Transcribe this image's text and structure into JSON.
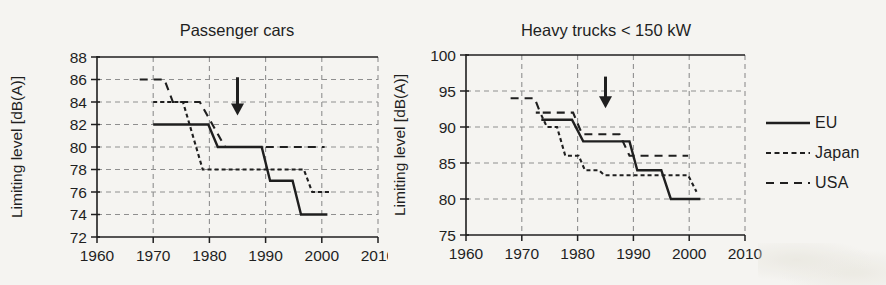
{
  "colors": {
    "ink": "#1f1f1f",
    "grid": "#8f8f8f",
    "background": "#f5f4f1"
  },
  "legend": {
    "items": [
      {
        "label": "EU",
        "style": "solid"
      },
      {
        "label": "Japan",
        "style": "short-dash"
      },
      {
        "label": "USA",
        "style": "long-dash"
      }
    ]
  },
  "chart_data": [
    {
      "type": "line",
      "title": "Passenger cars",
      "xlabel": "",
      "ylabel": "Limiting level [dB(A)]",
      "xlim": [
        1960,
        2010
      ],
      "ylim": [
        72,
        88
      ],
      "xticks": [
        1960,
        1970,
        1980,
        1990,
        2000,
        2010
      ],
      "yticks": [
        72,
        74,
        76,
        78,
        80,
        82,
        84,
        86,
        88
      ],
      "grid": true,
      "legend_position": "outside-right",
      "annotation_arrow": {
        "x": 1985,
        "y_from": 86.2,
        "y_to": 82.8
      },
      "series": [
        {
          "name": "EU",
          "style": "solid",
          "points": [
            [
              1970,
              82
            ],
            [
              1979.8,
              82
            ],
            [
              1981.5,
              80
            ],
            [
              1989.3,
              80
            ],
            [
              1990.8,
              77
            ],
            [
              1994.8,
              77
            ],
            [
              1996.3,
              74
            ],
            [
              2001,
              74
            ]
          ]
        },
        {
          "name": "Japan",
          "style": "short-dash",
          "points": [
            [
              1970,
              84
            ],
            [
              1975.3,
              84
            ],
            [
              1978.8,
              78
            ],
            [
              1996.8,
              78
            ],
            [
              1998.3,
              76
            ],
            [
              2001.5,
              76
            ]
          ]
        },
        {
          "name": "USA",
          "style": "long-dash",
          "points": [
            [
              1967.6,
              86
            ],
            [
              1972,
              86
            ],
            [
              1973.5,
              84
            ],
            [
              1978.3,
              84
            ],
            [
              1982.8,
              80
            ],
            [
              2000.5,
              80
            ]
          ]
        }
      ]
    },
    {
      "type": "line",
      "title": "Heavy trucks < 150 kW",
      "xlabel": "",
      "ylabel": "Limiting level [dB(A)]",
      "xlim": [
        1960,
        2010
      ],
      "ylim": [
        75,
        100
      ],
      "xticks": [
        1960,
        1970,
        1980,
        1990,
        2000,
        2010
      ],
      "yticks": [
        75,
        80,
        85,
        90,
        95,
        100
      ],
      "grid": true,
      "legend_position": "outside-right",
      "annotation_arrow": {
        "x": 1985,
        "y_from": 97.0,
        "y_to": 92.6
      },
      "series": [
        {
          "name": "EU",
          "style": "solid",
          "points": [
            [
              1973.5,
              91
            ],
            [
              1979,
              91
            ],
            [
              1981,
              88
            ],
            [
              1989.3,
              88
            ],
            [
              1990.7,
              84
            ],
            [
              1995,
              84
            ],
            [
              1996.7,
              80
            ],
            [
              2002,
              80
            ]
          ]
        },
        {
          "name": "Japan",
          "style": "short-dash",
          "points": [
            [
              1972.5,
              92
            ],
            [
              1973.3,
              92
            ],
            [
              1974.5,
              90
            ],
            [
              1976.3,
              90
            ],
            [
              1977.8,
              86
            ],
            [
              1980.2,
              86
            ],
            [
              1981.3,
              84
            ],
            [
              1983.8,
              84
            ],
            [
              1984.8,
              83.3
            ],
            [
              1999.8,
              83.3
            ],
            [
              2001.3,
              81
            ]
          ]
        },
        {
          "name": "USA",
          "style": "long-dash",
          "points": [
            [
              1968,
              94
            ],
            [
              1972.3,
              94
            ],
            [
              1973.3,
              92
            ],
            [
              1979.2,
              92
            ],
            [
              1980.8,
              89
            ],
            [
              1987.5,
              89
            ],
            [
              1989.3,
              86
            ],
            [
              1999.8,
              86
            ]
          ]
        }
      ]
    }
  ]
}
